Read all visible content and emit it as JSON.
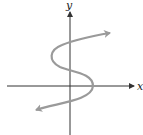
{
  "diagram": {
    "type": "graph-of-curve",
    "axes": {
      "x_label": "x",
      "y_label": "y",
      "axis_color": "#333333"
    },
    "curve": {
      "description": "S-shaped curve, x as a cubic function of y, arrows at both ends",
      "color": "#9a9a9a",
      "path": "M 36 110 C 55 103, 92 101, 93 86 C 93 73, 72 72, 60 67 C 48 61, 49 50, 62 45 C 74 40, 92 36, 110 33"
    }
  }
}
